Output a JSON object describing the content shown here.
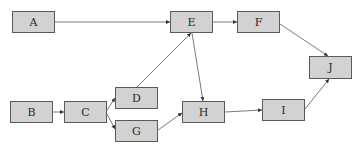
{
  "diagram": {
    "type": "directed-graph",
    "node_fill": "#d2d2d2",
    "node_border": "#5a5a5a",
    "edge_color": "#555555",
    "nodes": [
      {
        "id": "A",
        "label": "A",
        "x": 12,
        "y": 11,
        "w": 43,
        "h": 22
      },
      {
        "id": "E",
        "label": "E",
        "x": 170,
        "y": 11,
        "w": 43,
        "h": 22
      },
      {
        "id": "F",
        "label": "F",
        "x": 237,
        "y": 11,
        "w": 43,
        "h": 22
      },
      {
        "id": "J",
        "label": "J",
        "x": 309,
        "y": 56,
        "w": 43,
        "h": 23
      },
      {
        "id": "B",
        "label": "B",
        "x": 10,
        "y": 101,
        "w": 43,
        "h": 22
      },
      {
        "id": "C",
        "label": "C",
        "x": 64,
        "y": 101,
        "w": 43,
        "h": 22
      },
      {
        "id": "D",
        "label": "D",
        "x": 115,
        "y": 87,
        "w": 43,
        "h": 22
      },
      {
        "id": "G",
        "label": "G",
        "x": 115,
        "y": 120,
        "w": 43,
        "h": 22
      },
      {
        "id": "H",
        "label": "H",
        "x": 182,
        "y": 101,
        "w": 43,
        "h": 22
      },
      {
        "id": "I",
        "label": "I",
        "x": 262,
        "y": 99,
        "w": 43,
        "h": 22
      }
    ],
    "edges": [
      {
        "from": "A",
        "to": "E"
      },
      {
        "from": "E",
        "to": "F"
      },
      {
        "from": "F",
        "to": "J"
      },
      {
        "from": "B",
        "to": "C"
      },
      {
        "from": "C",
        "to": "D"
      },
      {
        "from": "C",
        "to": "G"
      },
      {
        "from": "D",
        "to": "E"
      },
      {
        "from": "E",
        "to": "H"
      },
      {
        "from": "G",
        "to": "H"
      },
      {
        "from": "H",
        "to": "I"
      },
      {
        "from": "I",
        "to": "J"
      }
    ]
  }
}
